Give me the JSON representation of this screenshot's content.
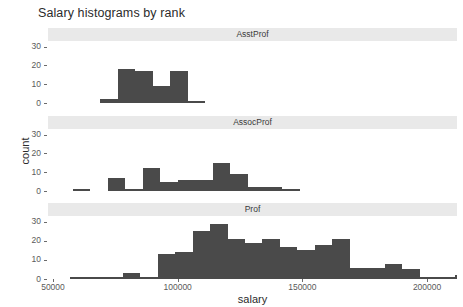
{
  "title": "Salary histograms by rank",
  "axis": {
    "x_label": "salary",
    "y_label": "count",
    "x_ticks": [
      "50000",
      "100000",
      "150000",
      "200000"
    ],
    "x_tick_values": [
      50000,
      100000,
      150000,
      200000
    ],
    "y_ticks": [
      "0",
      "10",
      "20",
      "30"
    ],
    "y_tick_values": [
      0,
      10,
      20,
      30
    ]
  },
  "facets": [
    {
      "label": "AsstProf"
    },
    {
      "label": "AssocProf"
    },
    {
      "label": "Prof"
    }
  ],
  "colors": {
    "bar_fill": "#4a4a4a",
    "strip_background": "#e9e9e9",
    "panel_background": "#ffffff",
    "text": "#4d4d4d",
    "tick": "#6b6b6b"
  },
  "chart_data": {
    "type": "bar",
    "title": "Salary histograms by rank",
    "xlabel": "salary",
    "ylabel": "count",
    "xlim": [
      48000,
      212000
    ],
    "ylim": [
      0,
      33
    ],
    "grid": false,
    "legend": null,
    "facet_variable": "rank",
    "bin_width": 7000,
    "panels": [
      {
        "facet": "AsstProf",
        "bins": [
          {
            "x0": 69000,
            "x1": 76000,
            "count": 2
          },
          {
            "x0": 76000,
            "x1": 83000,
            "count": 18
          },
          {
            "x0": 83000,
            "x1": 90000,
            "count": 17
          },
          {
            "x0": 90000,
            "x1": 97000,
            "count": 9
          },
          {
            "x0": 97000,
            "x1": 104000,
            "count": 17
          },
          {
            "x0": 104000,
            "x1": 111000,
            "count": 1
          }
        ]
      },
      {
        "facet": "AssocProf",
        "bins": [
          {
            "x0": 58000,
            "x1": 65000,
            "count": 1
          },
          {
            "x0": 72000,
            "x1": 79000,
            "count": 7
          },
          {
            "x0": 79000,
            "x1": 86000,
            "count": 1
          },
          {
            "x0": 86000,
            "x1": 93000,
            "count": 12
          },
          {
            "x0": 93000,
            "x1": 100000,
            "count": 5
          },
          {
            "x0": 100000,
            "x1": 107000,
            "count": 6
          },
          {
            "x0": 107000,
            "x1": 114000,
            "count": 6
          },
          {
            "x0": 114000,
            "x1": 121000,
            "count": 15
          },
          {
            "x0": 121000,
            "x1": 128000,
            "count": 9
          },
          {
            "x0": 128000,
            "x1": 135000,
            "count": 2
          },
          {
            "x0": 135000,
            "x1": 142000,
            "count": 2
          },
          {
            "x0": 142000,
            "x1": 149000,
            "count": 1
          }
        ]
      },
      {
        "facet": "Prof",
        "bins": [
          {
            "x0": 57000,
            "x1": 64000,
            "count": 1
          },
          {
            "x0": 64000,
            "x1": 71000,
            "count": 1
          },
          {
            "x0": 71000,
            "x1": 78000,
            "count": 1
          },
          {
            "x0": 78000,
            "x1": 85000,
            "count": 3
          },
          {
            "x0": 85000,
            "x1": 92000,
            "count": 1
          },
          {
            "x0": 92000,
            "x1": 99000,
            "count": 13
          },
          {
            "x0": 99000,
            "x1": 106000,
            "count": 14
          },
          {
            "x0": 106000,
            "x1": 113000,
            "count": 25
          },
          {
            "x0": 113000,
            "x1": 120000,
            "count": 29
          },
          {
            "x0": 120000,
            "x1": 127000,
            "count": 21
          },
          {
            "x0": 127000,
            "x1": 134000,
            "count": 19
          },
          {
            "x0": 134000,
            "x1": 141000,
            "count": 21
          },
          {
            "x0": 141000,
            "x1": 148000,
            "count": 17
          },
          {
            "x0": 148000,
            "x1": 155000,
            "count": 15
          },
          {
            "x0": 155000,
            "x1": 162000,
            "count": 18
          },
          {
            "x0": 162000,
            "x1": 169000,
            "count": 21
          },
          {
            "x0": 169000,
            "x1": 176000,
            "count": 6
          },
          {
            "x0": 176000,
            "x1": 183000,
            "count": 6
          },
          {
            "x0": 183000,
            "x1": 190000,
            "count": 8
          },
          {
            "x0": 190000,
            "x1": 197000,
            "count": 5
          },
          {
            "x0": 197000,
            "x1": 204000,
            "count": 1
          },
          {
            "x0": 204000,
            "x1": 211000,
            "count": 1
          },
          {
            "x0": 211000,
            "x1": 218000,
            "count": 2
          },
          {
            "x0": 218000,
            "x1": 225000,
            "count": 1
          },
          {
            "x0": 232000,
            "x1": 239000,
            "count": 1
          }
        ]
      }
    ]
  }
}
